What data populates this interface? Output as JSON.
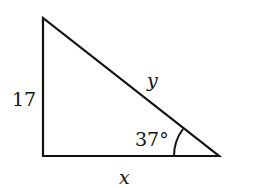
{
  "diagram": {
    "type": "right-triangle",
    "labels": {
      "left_side": "17",
      "hypotenuse": "y",
      "bottom_side": "x",
      "angle": "37°"
    },
    "colors": {
      "stroke": "#111111",
      "background": "#ffffff"
    }
  }
}
